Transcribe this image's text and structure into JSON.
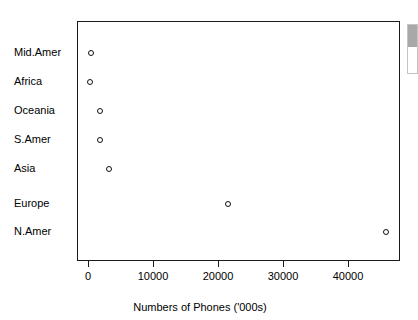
{
  "chart_data": {
    "type": "scatter",
    "title": "",
    "subtitle": "",
    "xlabel": "Numbers of Phones ('000s)",
    "ylabel": "",
    "grid": false,
    "legend": null,
    "xlim": [
      -1500,
      48000
    ],
    "xticks": [
      0,
      10000,
      20000,
      30000,
      40000
    ],
    "xtick_labels": [
      "0",
      "10000",
      "20000",
      "30000",
      "40000"
    ],
    "categories": [
      "Mid.Amer",
      "Africa",
      "Oceania",
      "S.Amer",
      "Asia",
      "Europe",
      "N.Amer"
    ],
    "values": [
      300,
      100,
      1700,
      1700,
      3000,
      21400,
      45700
    ],
    "points": [
      {
        "category": "Mid.Amer",
        "value": 300
      },
      {
        "category": "Africa",
        "value": 100
      },
      {
        "category": "Oceania",
        "value": 1700
      },
      {
        "category": "S.Amer",
        "value": 1700
      },
      {
        "category": "Asia",
        "value": 3000
      },
      {
        "category": "Europe",
        "value": 21400
      },
      {
        "category": "N.Amer",
        "value": 45700
      }
    ],
    "marker": "open-circle",
    "marker_color": "#111111",
    "panel_border_color": "#1a1a1a",
    "background_color": "#ffffff"
  },
  "scrollbar": {
    "name": "vertical-scrollbar"
  }
}
